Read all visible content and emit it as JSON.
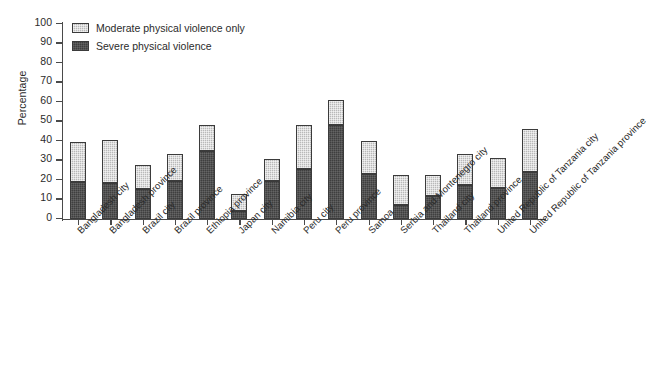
{
  "chart_data": {
    "type": "bar",
    "subtype": "stacked-vertical",
    "title": "",
    "xlabel": "",
    "ylabel": "Percentage",
    "ylim": [
      0,
      100
    ],
    "ytick_step": 10,
    "yticks": [
      0,
      10,
      20,
      30,
      40,
      50,
      60,
      70,
      80,
      90,
      100
    ],
    "grid": false,
    "legend_position": "top-left",
    "categories": [
      "Bangladesh city",
      "Bangladesh province",
      "Brazil city",
      "Brazil province",
      "Ethiopia province",
      "Japan city",
      "Namibia city",
      "Peru city",
      "Peru province",
      "Samoa",
      "Serbia and Montenegro city",
      "Thailand city",
      "Thailand province",
      "United Republic of Tanzania city",
      "United Republic of Tanzania province"
    ],
    "series": [
      {
        "name": "Severe physical violence",
        "color": "#3f3f3f",
        "values": [
          19,
          18.5,
          15.5,
          19.5,
          35,
          4,
          19.5,
          25.5,
          48,
          23,
          7,
          12,
          17.5,
          16,
          24
        ]
      },
      {
        "name": "Moderate physical violence only",
        "color": "#b9b9b9",
        "values": [
          20.5,
          22,
          12,
          14,
          13,
          9,
          11.5,
          22.5,
          13,
          17,
          15.5,
          10.5,
          16,
          15.5,
          22
        ]
      }
    ],
    "totals": [
      39.5,
      40.5,
      27.5,
      33.5,
      48,
      13,
      31,
      48,
      61,
      40,
      22.5,
      22.5,
      33.5,
      31.5,
      46
    ]
  },
  "legend": {
    "items": [
      {
        "label": "Moderate physical violence only",
        "key": "moderate"
      },
      {
        "label": "Severe physical violence",
        "key": "severe"
      }
    ]
  },
  "colors": {
    "severe": "#3f3f3f",
    "moderate": "#b9b9b9",
    "axis": "#4a4a4a",
    "text": "#2b2b2b",
    "background": "#ffffff"
  }
}
